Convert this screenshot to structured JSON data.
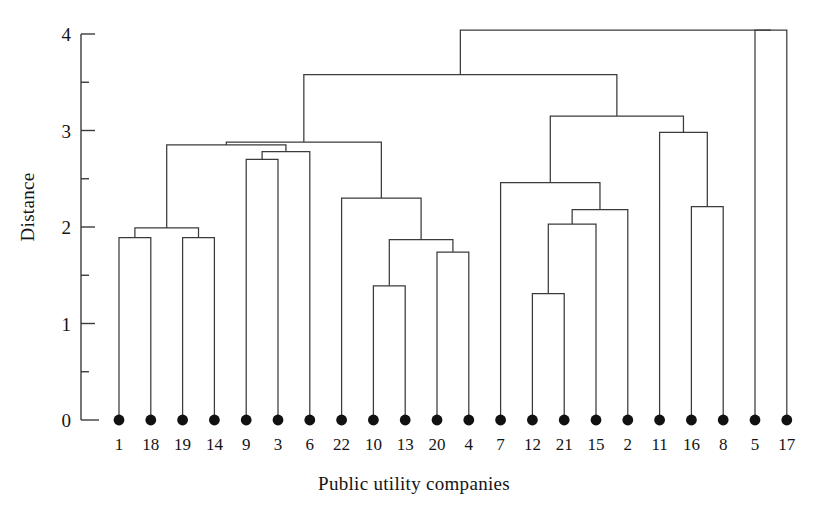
{
  "figure": {
    "y_axis_title": "Distance",
    "x_axis_title": "Public utility companies",
    "line_color": "#3b3b3b",
    "dot_color": "#111111",
    "text_color": "#141414",
    "background": "#ffffff"
  },
  "chart_data": {
    "type": "dendrogram",
    "title": "",
    "xlabel": "Public utility companies",
    "ylabel": "Distance",
    "ylim": [
      0,
      4
    ],
    "yticks": [
      0,
      1,
      2,
      3,
      4
    ],
    "ytick_labels": [
      "0",
      "1",
      "2",
      "3",
      "4"
    ],
    "minor_yticks": [
      0.5,
      1.5,
      2.5,
      3.5
    ],
    "grid": false,
    "legend": null,
    "leaf_order": [
      "1",
      "18",
      "19",
      "14",
      "9",
      "3",
      "6",
      "22",
      "10",
      "13",
      "20",
      "4",
      "7",
      "12",
      "21",
      "15",
      "2",
      "11",
      "16",
      "8",
      "5",
      "17"
    ],
    "leaf_count": 22,
    "merges": [
      {
        "id": "m1",
        "left": "1",
        "right": "18",
        "height": 1.89
      },
      {
        "id": "m2",
        "left": "19",
        "right": "14",
        "height": 1.89
      },
      {
        "id": "m3",
        "left": "m1",
        "right": "m2",
        "height": 1.99
      },
      {
        "id": "m4",
        "left": "9",
        "right": "3",
        "height": 2.7
      },
      {
        "id": "m5",
        "left": "m4",
        "right": "6",
        "height": 2.78
      },
      {
        "id": "m6",
        "left": "m3",
        "right": "m5",
        "height": 2.85
      },
      {
        "id": "m7",
        "left": "10",
        "right": "13",
        "height": 1.39
      },
      {
        "id": "m8",
        "left": "20",
        "right": "4",
        "height": 1.74
      },
      {
        "id": "m9",
        "left": "m7",
        "right": "m8",
        "height": 1.87
      },
      {
        "id": "m10",
        "left": "22",
        "right": "m9",
        "height": 2.3
      },
      {
        "id": "m11",
        "left": "m6",
        "right": "m10",
        "height": 2.88
      },
      {
        "id": "m12",
        "left": "12",
        "right": "21",
        "height": 1.31
      },
      {
        "id": "m13",
        "left": "m12",
        "right": "15",
        "height": 2.03
      },
      {
        "id": "m14",
        "left": "m13",
        "right": "2",
        "height": 2.18
      },
      {
        "id": "m15",
        "left": "7",
        "right": "m14",
        "height": 2.46
      },
      {
        "id": "m16",
        "left": "16",
        "right": "8",
        "height": 2.21
      },
      {
        "id": "m17",
        "left": "11",
        "right": "m16",
        "height": 2.98
      },
      {
        "id": "m18",
        "left": "m15",
        "right": "m17",
        "height": 3.15
      },
      {
        "id": "m19",
        "left": "m11",
        "right": "m18",
        "height": 3.58
      },
      {
        "id": "m20",
        "left": "5",
        "right": "17",
        "height": 4.04
      },
      {
        "id": "root",
        "left": "m19",
        "right": "m20",
        "height": 4.04
      }
    ]
  }
}
